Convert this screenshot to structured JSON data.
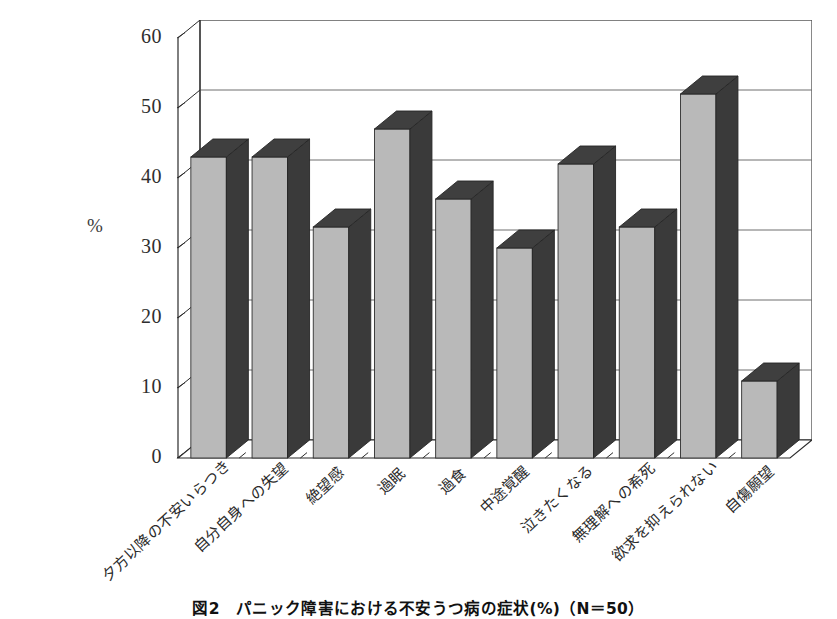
{
  "figure": {
    "axis_unit_label": "%",
    "caption": "図2　パニック障害における不安うつ病の症状(%)（N＝50）"
  },
  "colors": {
    "bar_face": "#b9b9b9",
    "bar_side": "#3a3a3a",
    "bar_top": "#3f3f3f",
    "gridline": "#6f6f6f",
    "axis": "#2b2b2b",
    "background": "#ffffff",
    "text": "#2b2b2b"
  },
  "chart_data": {
    "type": "bar",
    "title": "図2　パニック障害における不安うつ病の症状(%)（N＝50）",
    "xlabel": "",
    "ylabel": "%",
    "ylim": [
      0,
      60
    ],
    "yticks": [
      0,
      10,
      20,
      30,
      40,
      50,
      60
    ],
    "grid": true,
    "legend": false,
    "style": "3d-column",
    "n": 50,
    "categories": [
      "夕方以降の不安いらつき",
      "自分自身への失望",
      "絶望感",
      "過眠",
      "過食",
      "中途覚醒",
      "泣きたくなる",
      "無理解への希死",
      "欲求を抑えられない",
      "自傷願望"
    ],
    "values": [
      43,
      43,
      33,
      47,
      37,
      30,
      42,
      33,
      52,
      11
    ]
  }
}
